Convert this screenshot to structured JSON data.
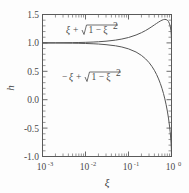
{
  "chart_data": {
    "type": "line",
    "title": "",
    "xlabel": "ξ",
    "ylabel": "h",
    "xscale": "log",
    "yscale": "linear",
    "xlim": [
      0.001,
      1.0
    ],
    "ylim": [
      -1.0,
      1.5
    ],
    "grid": false,
    "legend_position": "inline-annotations",
    "x_tick_labels": [
      "10-3",
      "10-2",
      "10-1",
      "100"
    ],
    "x_tick_mantissas": [
      "10",
      "10",
      "10",
      "10"
    ],
    "x_tick_exponents": [
      "-3",
      "-2",
      "-1",
      "0"
    ],
    "x_tick_values": [
      0.001,
      0.01,
      0.1,
      1.0
    ],
    "y_tick_labels": [
      "1.5",
      "1.0",
      "0.5",
      "0.0",
      "-0.5",
      "-1.0"
    ],
    "y_tick_values": [
      1.5,
      1.0,
      0.5,
      0.0,
      -0.5,
      -1.0
    ],
    "y_minor_step": 0.1,
    "series": [
      {
        "name": "upper",
        "label_text": "ξ + √(1 − ξ²)",
        "formula": "h = +xi + sqrt(1 - xi^2)",
        "color": "#555555",
        "x": [
          0.001,
          0.002,
          0.003,
          0.005,
          0.007,
          0.01,
          0.015,
          0.02,
          0.03,
          0.05,
          0.07,
          0.1,
          0.15,
          0.2,
          0.25,
          0.3,
          0.35,
          0.4,
          0.45,
          0.5,
          0.55,
          0.6,
          0.65,
          0.7,
          0.75,
          0.8,
          0.85,
          0.9,
          0.93,
          0.95,
          0.97,
          0.98,
          0.99,
          0.995,
          1.0
        ],
        "y": [
          1.001,
          1.002,
          1.003,
          1.005,
          1.007,
          1.01,
          1.015,
          1.02,
          1.03,
          1.049,
          1.068,
          1.095,
          1.139,
          1.18,
          1.218,
          1.254,
          1.287,
          1.317,
          1.343,
          1.366,
          1.385,
          1.4,
          1.41,
          1.414,
          1.411,
          1.4,
          1.377,
          1.336,
          1.298,
          1.262,
          1.213,
          1.179,
          1.131,
          1.095,
          1.0
        ]
      },
      {
        "name": "lower",
        "label_text": "−ξ + √(1 − ξ²)",
        "formula": "h = -xi + sqrt(1 - xi^2)",
        "color": "#555555",
        "x": [
          0.001,
          0.002,
          0.003,
          0.005,
          0.007,
          0.01,
          0.015,
          0.02,
          0.03,
          0.05,
          0.07,
          0.1,
          0.15,
          0.2,
          0.25,
          0.3,
          0.35,
          0.4,
          0.45,
          0.5,
          0.55,
          0.6,
          0.65,
          0.7,
          0.75,
          0.8,
          0.85,
          0.9,
          0.93,
          0.95,
          0.97,
          0.98,
          0.99,
          0.995,
          1.0
        ],
        "y": [
          0.999,
          0.998,
          0.997,
          0.995,
          0.993,
          0.99,
          0.985,
          0.98,
          0.969,
          0.949,
          0.928,
          0.895,
          0.839,
          0.78,
          0.718,
          0.654,
          0.587,
          0.517,
          0.443,
          0.366,
          0.285,
          0.2,
          0.11,
          0.014,
          -0.089,
          -0.2,
          -0.323,
          -0.464,
          -0.562,
          -0.638,
          -0.727,
          -0.781,
          -0.849,
          -0.895,
          -1.0
        ]
      }
    ],
    "annotations": [
      {
        "name": "upper-curve-label",
        "sign": "",
        "var": "ξ",
        "plus": "+",
        "radical_head": "1 − ξ",
        "sup": "2"
      },
      {
        "name": "lower-curve-label",
        "sign": "−",
        "var": "ξ",
        "plus": "+",
        "radical_head": "1 − ξ",
        "sup": "2"
      }
    ],
    "colors": {
      "axis": "#5a5a5a",
      "curve": "#555555",
      "text": "#4a4a4a",
      "background": "#fdfdfd"
    }
  }
}
